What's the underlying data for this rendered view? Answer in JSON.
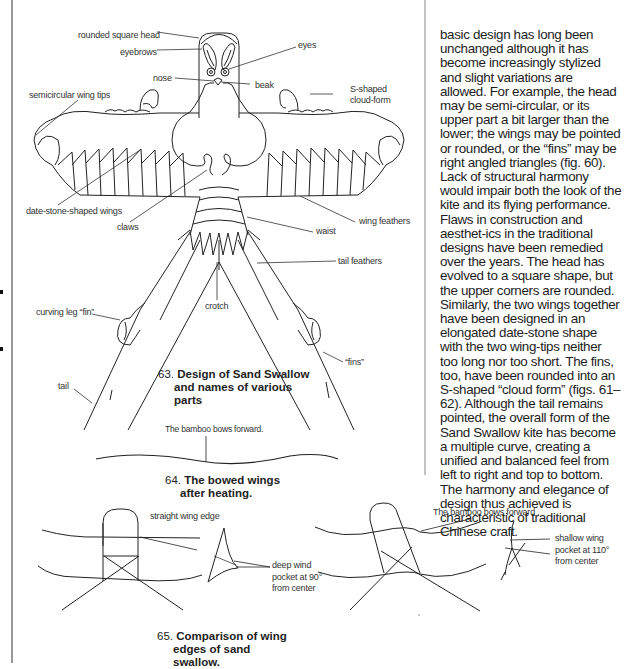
{
  "figure63": {
    "caption_number": "63.",
    "caption_text": "Design of Sand Swallow and names of various parts",
    "caption_lines": [
      "Design of Sand Swallow",
      "and names of various",
      "parts"
    ],
    "labels": {
      "rounded_square_head": "rounded  square head",
      "eyebrows": "eyebrows",
      "eyes": "eyes",
      "nose": "nose",
      "beak": "beak",
      "semicircular_wing_tips": "semicircular wing tips",
      "s_shaped_1": "S-shaped",
      "s_shaped_2": "cloud-form",
      "date_stone_wings": "date-stone-shaped wings",
      "claws": "claws",
      "wing_feathers": "wing feathers",
      "waist": "waist",
      "tail_feathers": "tail feathers",
      "crotch": "crotch",
      "curving_leg_fin": "curving leg “fin”",
      "fins": "“fins”",
      "tail": "tail"
    }
  },
  "figure64": {
    "label": "The bamboo bows forward.",
    "caption_number": "64.",
    "caption_lines": [
      "The bowed wings",
      "after heating."
    ]
  },
  "figure65": {
    "caption_number": "65.",
    "caption_lines": [
      "Comparison of wing",
      "edges of sand",
      "swallow."
    ],
    "left": {
      "straight_wing_edge": "straight wing  edge",
      "pocket_lines": [
        "deep wind",
        "pocket at 90°",
        "from center"
      ]
    },
    "right": {
      "bamboo_bows": "The bamboo bows forward .",
      "pocket_lines": [
        "shallow wing",
        "pocket at 110°",
        "from center"
      ]
    }
  },
  "body_text": {
    "paragraph": "basic design has long been unchanged although it has become increasingly stylized and slight variations are allowed. For example, the head may be semi-circular, or its upper part a bit larger than the lower; the wings may be pointed or rounded, or the “fins” may be right angled triangles (fig. 60). Lack of structural harmony would impair both the look of the kite and its flying performance. Flaws in construction and aesthet-ics in the traditional designs have been remedied over the years. The head has evolved to a square shape, but the upper corners are rounded. Similarly, the two wings together have been designed in an elongated date-stone shape with the two wing-tips neither too long nor too short. The fins, too, have been rounded into an S-shaped “cloud form” (figs. 61–62). Although the tail remains pointed, the overall form of the Sand Swallow kite has become a multiple curve, creating a unified and balanced feel from left to right and top to bottom. The harmony and elegance of design thus achieved is characteristic of traditional Chinese craft."
  }
}
